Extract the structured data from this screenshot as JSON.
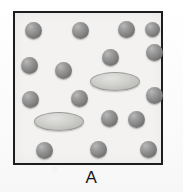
{
  "figure": {
    "panel_label": "A",
    "box": {
      "x": 13,
      "y": 11,
      "width": 150,
      "height": 154,
      "border_color": "#1d1d1d",
      "border_width": 2,
      "fill_color": "#f3f2f0"
    },
    "background_color": "#fdfdfd",
    "legend_note": "",
    "particles": {
      "sphere_color": "#878787",
      "sphere_count": 16,
      "disc_color": "#cfcfcc",
      "disc_count": 2,
      "spheres": [
        {
          "cx": 31,
          "cy": 28,
          "d": 17
        },
        {
          "cx": 78,
          "cy": 28,
          "d": 17
        },
        {
          "cx": 124,
          "cy": 27,
          "d": 17
        },
        {
          "cx": 152,
          "cy": 50,
          "d": 17
        },
        {
          "cx": 108,
          "cy": 55,
          "d": 17
        },
        {
          "cx": 27,
          "cy": 63,
          "d": 17
        },
        {
          "cx": 61,
          "cy": 68,
          "d": 17
        },
        {
          "cx": 152,
          "cy": 93,
          "d": 17
        },
        {
          "cx": 28,
          "cy": 97,
          "d": 17
        },
        {
          "cx": 77,
          "cy": 96,
          "d": 17
        },
        {
          "cx": 107,
          "cy": 116,
          "d": 17
        },
        {
          "cx": 134,
          "cy": 117,
          "d": 17
        },
        {
          "cx": 42,
          "cy": 148,
          "d": 17
        },
        {
          "cx": 96,
          "cy": 147,
          "d": 17
        },
        {
          "cx": 146,
          "cy": 147,
          "d": 17
        },
        {
          "cx": 150,
          "cy": 27,
          "d": 15
        }
      ],
      "discs": [
        {
          "cx": 113,
          "cy": 79,
          "w": 50,
          "h": 19
        },
        {
          "cx": 57,
          "cy": 119,
          "w": 50,
          "h": 19
        }
      ]
    }
  }
}
